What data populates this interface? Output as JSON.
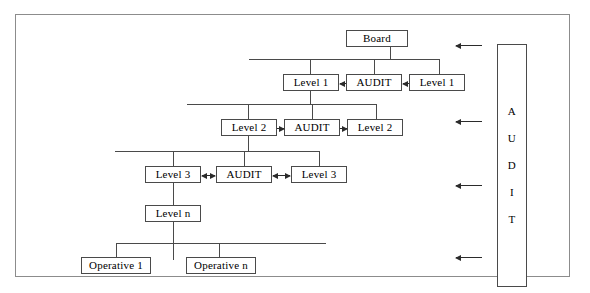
{
  "diagram": {
    "title_text_present": false,
    "colors": {
      "frame_border": "#8c8c8c",
      "node_border": "#4a4a4a",
      "connector": "#4a4a4a",
      "arrow": "#2b2b2b",
      "background": "#ffffff",
      "text": "#000000"
    },
    "audit_column": {
      "label": "AUDIT",
      "letters": [
        "A",
        "U",
        "D",
        "I",
        "T"
      ]
    },
    "nodes": {
      "board": "Board",
      "level1_left": "Level 1",
      "level1_audit": "AUDIT",
      "level1_right": "Level 1",
      "level2_left": "Level 2",
      "level2_audit": "AUDIT",
      "level2_right": "Level 2",
      "level3_left": "Level 3",
      "level3_audit": "AUDIT",
      "level3_right": "Level 3",
      "level_n": "Level n",
      "operative_1": "Operative 1",
      "operative_n": "Operative n"
    },
    "arrows": {
      "level1_audit_to_left": "left",
      "level1_right_to_audit": "left",
      "level2_left_to_audit": "right",
      "level2_audit_to_right": "right",
      "level3_left_audit": "both",
      "level3_audit_right": "both",
      "audit_column_feeds": [
        "left",
        "left",
        "left",
        "left"
      ],
      "audit_column_feed_count": 4
    }
  }
}
